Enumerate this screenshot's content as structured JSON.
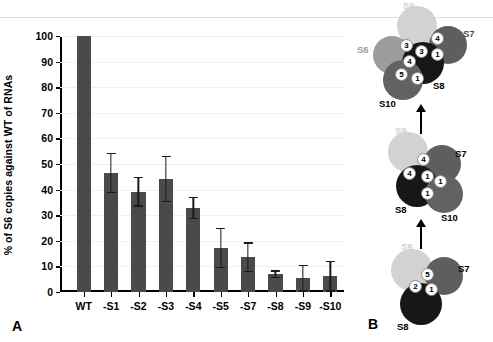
{
  "panels": {
    "a_letter": "A",
    "b_letter": "B"
  },
  "chart_data": {
    "type": "bar",
    "title": "",
    "xlabel": "",
    "ylabel": "% of S6 copies against WT of RNAs",
    "ylim": [
      0,
      100
    ],
    "ytick_labels": [
      "0",
      "10",
      "20",
      "30",
      "40",
      "50",
      "60",
      "70",
      "80",
      "90",
      "100"
    ],
    "ytick_values": [
      0,
      10,
      20,
      30,
      40,
      50,
      60,
      70,
      80,
      90,
      100
    ],
    "grid": true,
    "legend": "none",
    "categories": [
      "WT",
      "-S1",
      "-S2",
      "-S3",
      "-S4",
      "-S5",
      "-S7",
      "-S8",
      "-S9",
      "-S10"
    ],
    "values": [
      100,
      46.5,
      39.2,
      44.2,
      32.8,
      17.2,
      13.6,
      7.0,
      5.4,
      6.2
    ],
    "errors": [
      0,
      8.0,
      5.8,
      9.0,
      4.4,
      7.8,
      5.8,
      1.5,
      5.2,
      6.0
    ],
    "bar_color": "#4a4a4a"
  },
  "diagram": {
    "colors": {
      "S6": "#9c9c9c",
      "S7": "#5e5e5e",
      "S8": "#171717",
      "S9": "#d2d2d2",
      "S10": "#626262",
      "node_fill": "#ffffff",
      "node_text": "#000000"
    },
    "stages": [
      {
        "name": "stage-top",
        "proteins": [
          {
            "label": "S9",
            "color_key": "S9"
          },
          {
            "label": "S6",
            "color_key": "S6"
          },
          {
            "label": "S7",
            "color_key": "S7"
          },
          {
            "label": "S8",
            "color_key": "S8"
          },
          {
            "label": "S10",
            "color_key": "S10"
          }
        ],
        "nodes": [
          "3",
          "4",
          "3",
          "1",
          "4",
          "5",
          "1"
        ]
      },
      {
        "name": "stage-middle",
        "proteins": [
          {
            "label": "S9",
            "color_key": "S9"
          },
          {
            "label": "S7",
            "color_key": "S7"
          },
          {
            "label": "S8",
            "color_key": "S8"
          },
          {
            "label": "S10",
            "color_key": "S10"
          }
        ],
        "nodes": [
          "4",
          "4",
          "1",
          "1",
          "1"
        ]
      },
      {
        "name": "stage-bottom",
        "proteins": [
          {
            "label": "S9",
            "color_key": "S9"
          },
          {
            "label": "S7",
            "color_key": "S7"
          },
          {
            "label": "S8",
            "color_key": "S8"
          }
        ],
        "nodes": [
          "5",
          "2",
          "1"
        ]
      }
    ]
  }
}
